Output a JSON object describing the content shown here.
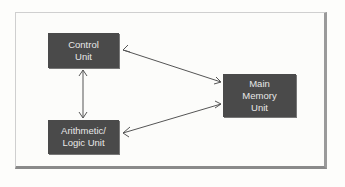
{
  "diagram": {
    "nodes": [
      {
        "id": "control",
        "label": "Control\nUnit"
      },
      {
        "id": "alu",
        "label": "Arithmetic/\nLogic Unit"
      },
      {
        "id": "memory",
        "label": "Main\nMemory\nUnit"
      }
    ],
    "edges": [
      {
        "from": "control",
        "to": "alu",
        "direction": "both"
      },
      {
        "from": "control",
        "to": "memory",
        "direction": "both"
      },
      {
        "from": "alu",
        "to": "memory",
        "direction": "both"
      }
    ],
    "colors": {
      "box": "#4a4a4a",
      "text": "#e8e8e8",
      "line": "#555555",
      "frame_shadow": "#8a8a8a"
    }
  }
}
